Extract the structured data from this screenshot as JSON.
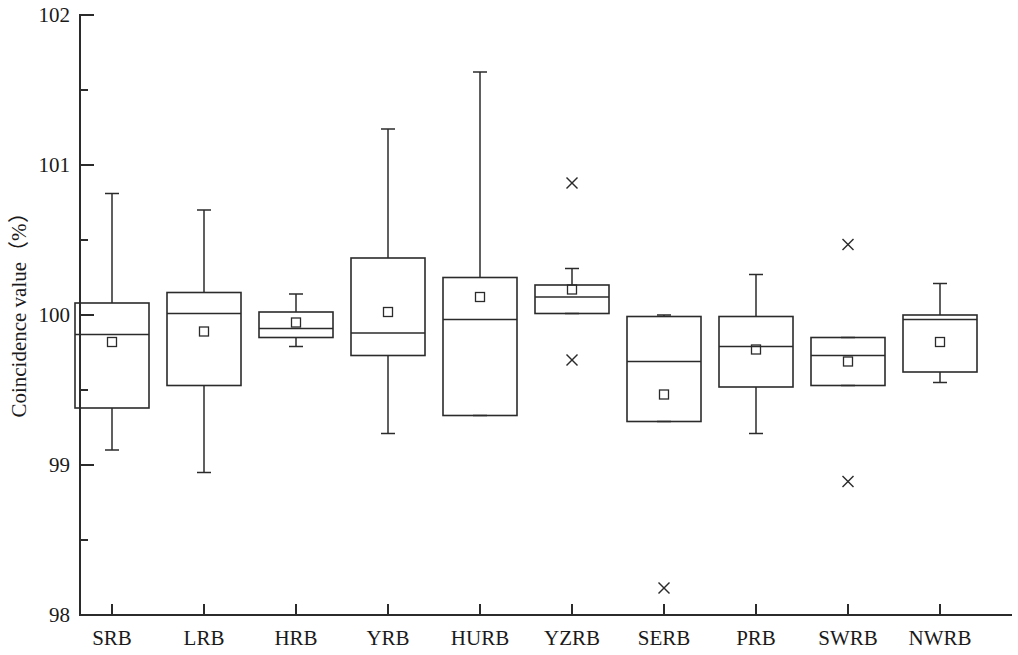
{
  "chart_data": {
    "type": "box",
    "title": "",
    "xlabel": "",
    "ylabel": "Coincidence value（%）",
    "ylim": [
      98,
      102
    ],
    "ytick_labels": [
      "102",
      "101",
      "100",
      "99",
      "98"
    ],
    "ytick_values": [
      102,
      101,
      100,
      99,
      98
    ],
    "yminor_values": [
      101.5,
      100.5,
      99.5,
      98.5
    ],
    "grid": false,
    "legend": null,
    "categories": [
      "SRB",
      "LRB",
      "HRB",
      "YRB",
      "HURB",
      "YZRB",
      "SERB",
      "PRB",
      "SWRB",
      "NWRB"
    ],
    "boxes": [
      {
        "category": "SRB",
        "whisker_high": 100.81,
        "q3": 100.08,
        "median": 99.87,
        "mean": 99.82,
        "q1": 99.38,
        "whisker_low": 99.1,
        "outliers": []
      },
      {
        "category": "LRB",
        "whisker_high": 100.7,
        "q3": 100.15,
        "median": 100.01,
        "mean": 99.89,
        "q1": 99.53,
        "whisker_low": 98.95,
        "outliers": []
      },
      {
        "category": "HRB",
        "whisker_high": 100.14,
        "q3": 100.02,
        "median": 99.91,
        "mean": 99.95,
        "q1": 99.85,
        "whisker_low": 99.79,
        "outliers": []
      },
      {
        "category": "YRB",
        "whisker_high": 101.24,
        "q3": 100.38,
        "median": 99.88,
        "mean": 100.02,
        "q1": 99.73,
        "whisker_low": 99.21,
        "outliers": []
      },
      {
        "category": "HURB",
        "whisker_high": 101.62,
        "q3": 100.25,
        "median": 99.97,
        "mean": 100.12,
        "q1": 99.33,
        "whisker_low": 99.33,
        "outliers": []
      },
      {
        "category": "YZRB",
        "whisker_high": 100.31,
        "q3": 100.2,
        "median": 100.12,
        "mean": 100.17,
        "q1": 100.01,
        "whisker_low": 100.01,
        "outliers": [
          100.88,
          99.7
        ]
      },
      {
        "category": "SERB",
        "whisker_high": 100.0,
        "q3": 99.99,
        "median": 99.69,
        "mean": 99.47,
        "q1": 99.29,
        "whisker_low": 99.29,
        "outliers": [
          98.18
        ]
      },
      {
        "category": "PRB",
        "whisker_high": 100.27,
        "q3": 99.99,
        "median": 99.79,
        "mean": 99.77,
        "q1": 99.52,
        "whisker_low": 99.21,
        "outliers": []
      },
      {
        "category": "SWRB",
        "whisker_high": 99.85,
        "q3": 99.85,
        "median": 99.73,
        "mean": 99.69,
        "q1": 99.53,
        "whisker_low": 99.53,
        "outliers": [
          100.47,
          98.89
        ]
      },
      {
        "category": "NWRB",
        "whisker_high": 100.21,
        "q3": 100.0,
        "median": 99.97,
        "mean": 99.82,
        "q1": 99.62,
        "whisker_low": 99.55,
        "outliers": []
      }
    ],
    "marker_styles": {
      "mean": "open-square",
      "outlier": "cross",
      "whisker_cap": "short-horizontal-bar"
    },
    "colors": {
      "line": "#2b2b2b",
      "fill": "#ffffff",
      "background": "#ffffff"
    }
  }
}
